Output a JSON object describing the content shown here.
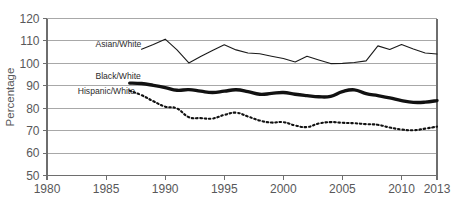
{
  "chart_data": {
    "type": "line",
    "title": "",
    "xlabel": "",
    "ylabel": "Percentage",
    "xlim": [
      1980,
      2013
    ],
    "ylim": [
      50,
      120
    ],
    "ytick_values": [
      50,
      60,
      70,
      80,
      90,
      100,
      110,
      120
    ],
    "ytick_labels": [
      "50",
      "60",
      "70",
      "80",
      "90",
      "100",
      "110",
      "120"
    ],
    "xtick_values": [
      1980,
      1985,
      1990,
      1995,
      2000,
      2005,
      2010,
      2013
    ],
    "xtick_labels": [
      "1980",
      "1985",
      "1990",
      "1995",
      "2000",
      "2005",
      "2010",
      "2013"
    ],
    "grid": true,
    "grid_axis": "y",
    "legend": "inline-labels",
    "series": [
      {
        "name": "Asian/White",
        "style": "thin-solid",
        "color": "#1a1a1a",
        "label_x": 1984.1,
        "label_y": 107.4,
        "x": [
          1988,
          1989,
          1990,
          1991,
          1992,
          1993,
          1994,
          1995,
          1996,
          1997,
          1998,
          1999,
          2000,
          2001,
          2002,
          2003,
          2004,
          2005,
          2006,
          2007,
          2008,
          2009,
          2010,
          2011,
          2012,
          2013
        ],
        "y": [
          106.3,
          108.4,
          110.8,
          106.0,
          100.2,
          103.1,
          105.7,
          108.3,
          106.0,
          104.6,
          104.3,
          103.2,
          102.2,
          100.6,
          103.2,
          101.5,
          99.9,
          100.0,
          100.4,
          101.1,
          107.8,
          106.2,
          108.4,
          106.4,
          104.6,
          104.2
        ]
      },
      {
        "name": "Black/White",
        "style": "thick-solid",
        "color": "#111111",
        "label_x": 1984.1,
        "label_y": 93.2,
        "x": [
          1987,
          1988,
          1989,
          1990,
          1991,
          1992,
          1993,
          1994,
          1995,
          1996,
          1997,
          1998,
          1999,
          2000,
          2001,
          2002,
          2003,
          2004,
          2005,
          2006,
          2007,
          2008,
          2009,
          2010,
          2011,
          2012,
          2013
        ],
        "y": [
          91.2,
          91.0,
          90.2,
          89.2,
          88.0,
          88.3,
          87.6,
          87.0,
          87.6,
          88.2,
          87.4,
          86.2,
          86.6,
          87.0,
          86.2,
          85.6,
          85.1,
          85.3,
          87.4,
          88.2,
          86.5,
          85.6,
          84.6,
          83.4,
          82.6,
          82.7,
          83.4
        ]
      },
      {
        "name": "Hispanic/White",
        "style": "dotted",
        "color": "#111111",
        "label_x": 1982.6,
        "label_y": 86.3,
        "x": [
          1987,
          1988,
          1989,
          1990,
          1991,
          1992,
          1993,
          1994,
          1995,
          1996,
          1997,
          1998,
          1999,
          2000,
          2001,
          2002,
          2003,
          2004,
          2005,
          2006,
          2007,
          2008,
          2009,
          2010,
          2011,
          2012,
          2013
        ],
        "y": [
          87.8,
          85.8,
          83.1,
          80.7,
          79.9,
          76.0,
          75.6,
          75.4,
          77.0,
          78.0,
          76.3,
          74.5,
          73.6,
          73.8,
          72.3,
          71.6,
          73.2,
          73.8,
          73.5,
          73.3,
          72.9,
          72.6,
          71.4,
          70.5,
          70.2,
          70.9,
          71.8
        ]
      }
    ]
  }
}
